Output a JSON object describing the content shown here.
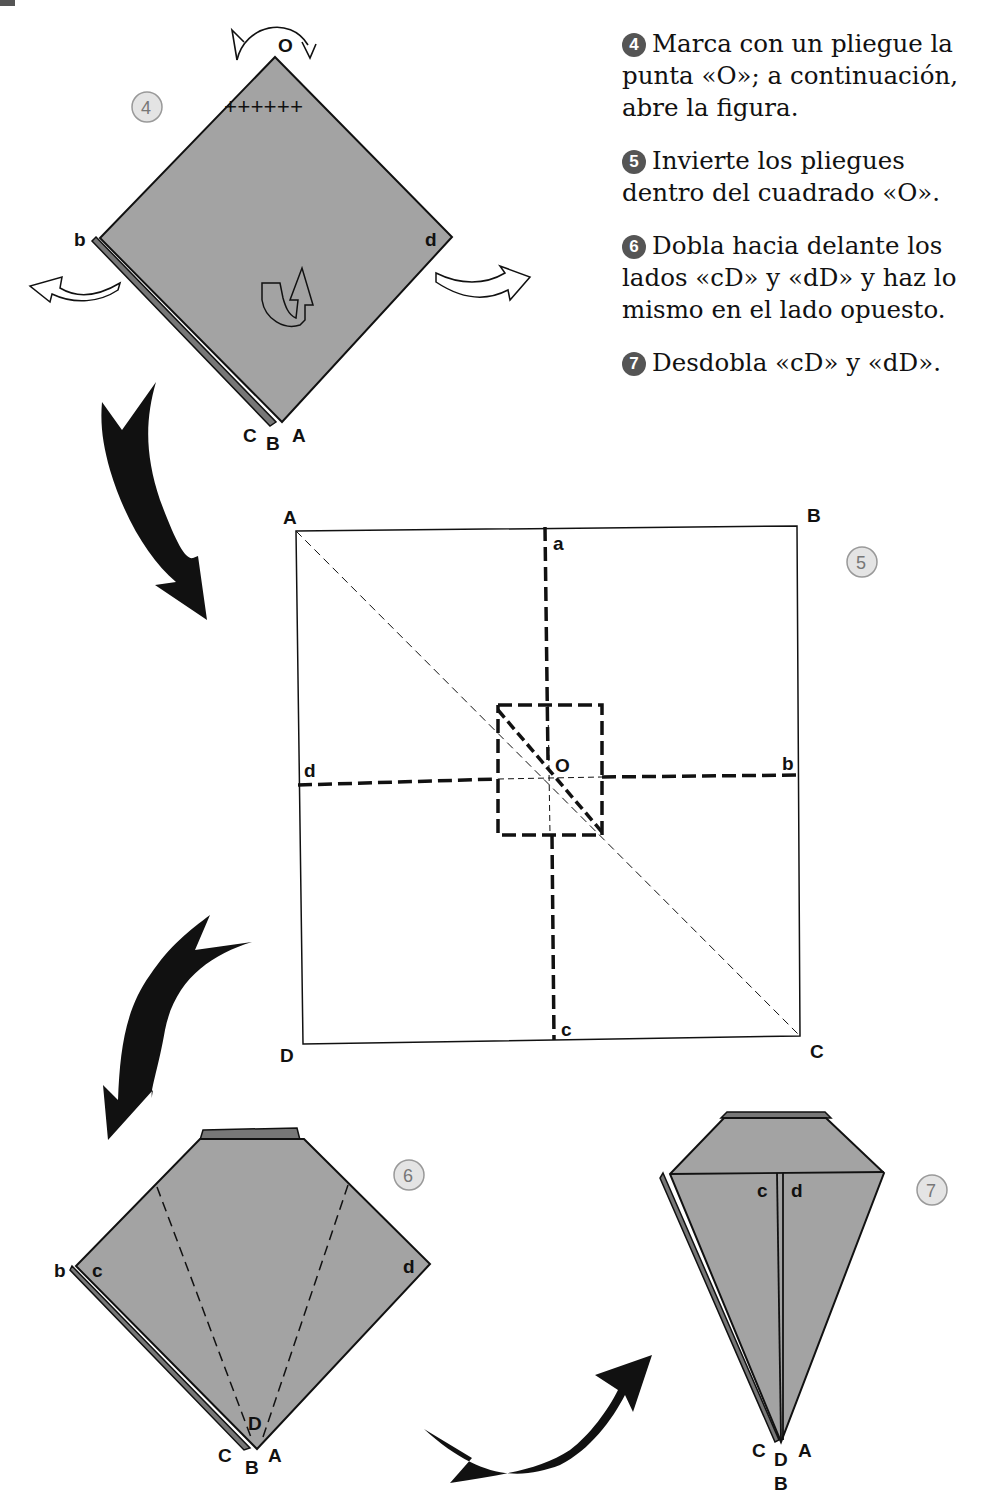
{
  "page": {
    "colors": {
      "paper": "#a3a3a3",
      "paper_dark": "#7a7a7a",
      "ink": "#111111",
      "badge": "#555555",
      "step_circle": "#e4e4e4"
    }
  },
  "instructions": [
    {
      "num": "4",
      "text": "Marca con un pliegue la punta «O»; a continuación, abre la figura."
    },
    {
      "num": "5",
      "text": "Invierte los pliegues dentro del cuadrado «O»."
    },
    {
      "num": "6",
      "text": "Dobla hacia delante los lados «cD» y «dD» y haz lo mismo en el lado opuesto."
    },
    {
      "num": "7",
      "text": "Desdobla «cD» y «dD»."
    }
  ],
  "step4": {
    "step_label": "4",
    "labels": {
      "top": "O",
      "left": "b",
      "right": "d",
      "bottom_c": "C",
      "bottom_b": "B",
      "bottom_a": "A"
    },
    "crease_marks": "++++++",
    "icons": [
      "fold-back-arrow-icon",
      "open-left-arrow-icon",
      "open-right-arrow-icon",
      "turn-over-icon"
    ]
  },
  "step5": {
    "step_label": "5",
    "labels": {
      "tl": "A",
      "tr": "B",
      "br": "C",
      "bl": "D",
      "top": "a",
      "right": "b",
      "bottom": "c",
      "left": "d",
      "center": "O"
    }
  },
  "step6": {
    "step_label": "6",
    "labels": {
      "left_b": "b",
      "left_c": "c",
      "right_d": "d",
      "inner_d": "D",
      "bottom_c": "C",
      "bottom_b": "B",
      "bottom_a": "A"
    }
  },
  "step7": {
    "step_label": "7",
    "labels": {
      "c": "c",
      "d": "d",
      "bottom_c": "C",
      "bottom_d": "D",
      "bottom_a": "A",
      "bottom_b": "B"
    }
  }
}
